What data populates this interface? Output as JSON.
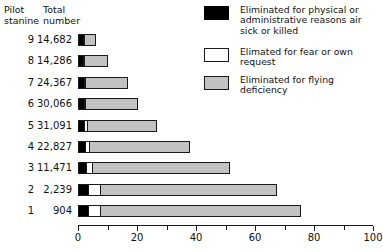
{
  "table_headers": {
    "stanine": "Pilot\nstanine",
    "number": "Total\nnumber"
  },
  "legend": {
    "items": [
      {
        "key": "physical",
        "color": "#000000",
        "label": "Eliminated for physical or\nadministrative reasons  air\nsick or killed"
      },
      {
        "key": "fear",
        "color": "#ffffff",
        "label": "Elimated for fear or  own\nrequest"
      },
      {
        "key": "flying",
        "color": "#c2c2c2",
        "label": "Eliminated for flying\ndeficiency"
      }
    ]
  },
  "chart_data": {
    "type": "bar",
    "orientation": "horizontal",
    "stacked": true,
    "title": "",
    "xlabel": "",
    "ylabel": "Pilot stanine",
    "xlim": [
      0,
      100
    ],
    "xticks": [
      0,
      10,
      20,
      30,
      40,
      50,
      60,
      70,
      80,
      90,
      100
    ],
    "xtick_labels": [
      "0",
      "",
      "20",
      "",
      "40",
      "",
      "60",
      "",
      "80",
      "",
      "100"
    ],
    "grid": false,
    "legend_position": "top-right",
    "categories": [
      "9",
      "8",
      "7",
      "6",
      "5",
      "4",
      "3",
      "2",
      "1"
    ],
    "total_numbers": [
      "14,682",
      "14,286",
      "24,367",
      "30,066",
      "31,091",
      "22,827",
      "11,471",
      "2,239",
      "904"
    ],
    "series": [
      {
        "name": "Eliminated for physical or administrative reasons air sick or killed",
        "color": "#000000",
        "values": [
          2.0,
          2.2,
          2.3,
          2.3,
          2.4,
          2.7,
          3.0,
          3.6,
          3.6
        ]
      },
      {
        "name": "Elimated for fear or own request",
        "color": "#ffffff",
        "values": [
          0.4,
          0.5,
          0.6,
          0.7,
          1.4,
          1.8,
          2.3,
          4.6,
          4.6
        ]
      },
      {
        "name": "Eliminated for flying deficiency",
        "color": "#c2c2c2",
        "values": [
          4.0,
          8.0,
          14.5,
          18.0,
          23.5,
          34.0,
          47.0,
          60.0,
          68.0
        ]
      }
    ],
    "totals": [
      6.4,
      10.7,
      17.4,
      21.0,
      27.3,
      38.5,
      52.3,
      68.2,
      76.2
    ]
  }
}
